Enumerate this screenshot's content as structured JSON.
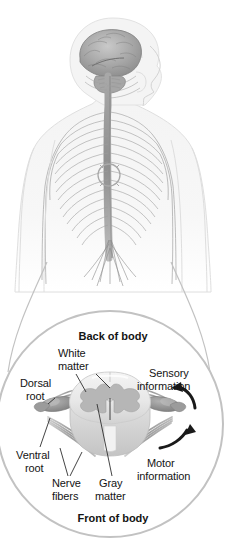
{
  "figure": {
    "title_visible": false,
    "type": "anatomical-illustration",
    "background_color": "#ffffff"
  },
  "body_panel": {
    "name": "human-nervous-system-figure",
    "description_parts": [
      "head-profile-with-brain",
      "brainstem",
      "spinal-cord",
      "spinal-nerve-branches",
      "torso-outline",
      "arms"
    ],
    "highlight_marker": "spinal-cord-section-circle"
  },
  "inset": {
    "shape": "circle",
    "orientation_labels": {
      "top": "Back of body",
      "bottom": "Front of body"
    },
    "labels": [
      {
        "id": "white-matter",
        "text_lines": [
          "White",
          "matter"
        ],
        "side": "left"
      },
      {
        "id": "dorsal-root",
        "text_lines": [
          "Dorsal",
          "root"
        ],
        "side": "left"
      },
      {
        "id": "ventral-root",
        "text_lines": [
          "Ventral",
          "root"
        ],
        "side": "left"
      },
      {
        "id": "nerve-fibers",
        "text_lines": [
          "Nerve",
          "fibers"
        ],
        "side": "left"
      },
      {
        "id": "gray-matter",
        "text_lines": [
          "Gray",
          "matter"
        ],
        "side": "center"
      },
      {
        "id": "sensory-information",
        "text_lines": [
          "Sensory",
          "information"
        ],
        "side": "right"
      },
      {
        "id": "motor-information",
        "text_lines": [
          "Motor",
          "information"
        ],
        "side": "right"
      }
    ],
    "text": {
      "back_of_body": "Back of body",
      "front_of_body": "Front of body",
      "white": "White",
      "matter": "matter",
      "dorsal": "Dorsal",
      "root": "root",
      "ventral": "Ventral",
      "ventral_root_second_line": "root",
      "nerve": "Nerve",
      "fibers": "fibers",
      "gray": "Gray",
      "gray_matter_second_line": "matter",
      "sensory": "Sensory",
      "sensory_information": "information",
      "motor": "Motor",
      "motor_information": "information"
    },
    "arrows": [
      {
        "id": "sensory-arrow",
        "direction": "inward-up-left"
      },
      {
        "id": "motor-arrow",
        "direction": "outward-up-right"
      }
    ]
  },
  "colors": {
    "outline_gray": "#b9b9b9",
    "white_matter": "#ececec",
    "white_matter_shade": "#dcdcdc",
    "gray_matter": "#b4b4b4",
    "nerve_gray": "#9a9a9a",
    "ganglion_gray": "#8d8d8d",
    "leader_line": "#3a3a3a",
    "arrow_black": "#1a1a1a",
    "body_outline": "#d8d8d8",
    "brain_gray": "#9c9c9c",
    "text": "#141414"
  }
}
